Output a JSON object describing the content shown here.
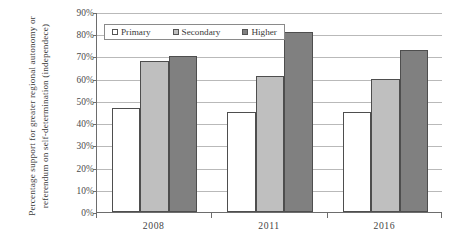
{
  "chart_data": {
    "type": "bar",
    "title": "",
    "subtitle": "",
    "categories": [
      "2008",
      "2011",
      "2016"
    ],
    "series": [
      {
        "name": "Primary",
        "values": [
          47,
          45,
          45
        ],
        "color": "#ffffff"
      },
      {
        "name": "Secondary",
        "values": [
          68,
          61,
          60
        ],
        "color": "#bfbfbf"
      },
      {
        "name": "Higher",
        "values": [
          70,
          81,
          73
        ],
        "color": "#808080"
      }
    ],
    "xlabel": "",
    "ylabel": "Percentage support for greater regional autonomy or referendum on self-determination (independece)",
    "ylim": [
      0,
      90
    ],
    "ytick_values": [
      0,
      10,
      20,
      30,
      40,
      50,
      60,
      70,
      80,
      90
    ],
    "ytick_labels": [
      "0%",
      "10%",
      "20%",
      "30%",
      "40%",
      "50%",
      "60%",
      "70%",
      "80%",
      "90%"
    ],
    "grid": true,
    "grid_axis": "y",
    "legend_position": "top-left-inside",
    "value_unit": "percent"
  },
  "legend": {
    "items": [
      {
        "label": "Primary",
        "swatch": "legend-swatch-primary"
      },
      {
        "label": "Secondary",
        "swatch": "legend-swatch-secondary"
      },
      {
        "label": "Higher",
        "swatch": "legend-swatch-higher"
      }
    ]
  },
  "colors": {
    "primary": "#ffffff",
    "secondary": "#bfbfbf",
    "higher": "#808080",
    "axis": "#6d6d6d",
    "gridline": "#b9b9b9",
    "bar_outline": "#4e4e4e",
    "text": "#3a3a3a",
    "background": "#ffffff"
  }
}
